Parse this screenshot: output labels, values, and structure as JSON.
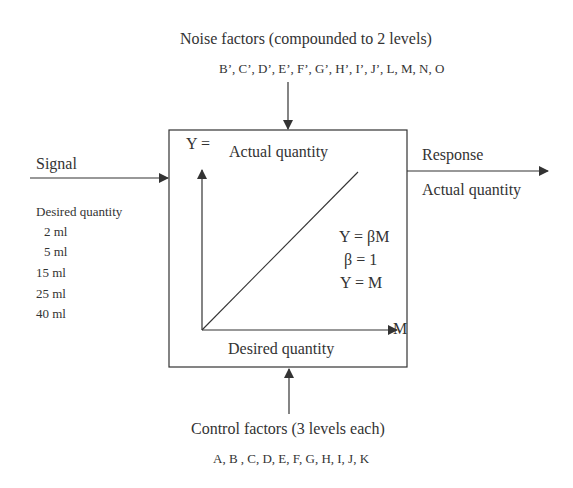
{
  "noise": {
    "title": "Noise factors (compounded to 2 levels)",
    "factors": "B’, C’, D’, E’, F’, G’, H’, I’, J’, L, M, N, O"
  },
  "signal": {
    "label": "Signal",
    "desired_label": "Desired quantity",
    "levels": [
      "2 ml",
      "5 ml",
      "15 ml",
      "25 ml",
      "40 ml"
    ]
  },
  "system": {
    "y_axis_label": "Y =",
    "y_axis_name": "Actual quantity",
    "x_axis_name": "Desired quantity",
    "x_axis_symbol": "M",
    "equations": [
      "Y = βM",
      "β = 1",
      "Y = M"
    ]
  },
  "response": {
    "label": "Response",
    "value_label": "Actual quantity"
  },
  "control": {
    "title": "Control factors (3 levels each)",
    "factors": "A, B , C, D, E, F, G, H, I, J, K"
  },
  "colors": {
    "line": "#333333",
    "text": "#333333",
    "background": "#ffffff"
  }
}
